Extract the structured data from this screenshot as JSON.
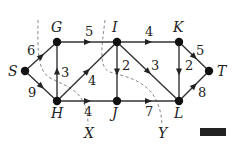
{
  "nodes": [
    {
      "id": "S",
      "label": "S",
      "x": 25,
      "y": 71,
      "lx": 8,
      "ly": 76
    },
    {
      "id": "G",
      "label": "G",
      "x": 57,
      "y": 42,
      "lx": 51,
      "ly": 32
    },
    {
      "id": "I",
      "label": "I",
      "x": 117,
      "y": 42,
      "lx": 112,
      "ly": 32
    },
    {
      "id": "K",
      "label": "K",
      "x": 179,
      "y": 42,
      "lx": 173,
      "ly": 32
    },
    {
      "id": "T",
      "label": "T",
      "x": 209,
      "y": 71,
      "lx": 217,
      "ly": 76
    },
    {
      "id": "H",
      "label": "H",
      "x": 57,
      "y": 101,
      "lx": 51,
      "ly": 118
    },
    {
      "id": "J",
      "label": "J",
      "x": 117,
      "y": 101,
      "lx": 112,
      "ly": 118
    },
    {
      "id": "L",
      "label": "L",
      "x": 179,
      "y": 101,
      "lx": 174,
      "ly": 118
    }
  ],
  "edges": [
    {
      "from": "S",
      "to": "G",
      "weight": "6",
      "wx": 27,
      "wy": 55
    },
    {
      "from": "S",
      "to": "H",
      "weight": "9",
      "wx": 28,
      "wy": 97
    },
    {
      "from": "H",
      "to": "G",
      "weight": "3",
      "wx": 61,
      "wy": 77
    },
    {
      "from": "G",
      "to": "I",
      "weight": "5",
      "wx": 85,
      "wy": 36
    },
    {
      "from": "H",
      "to": "I",
      "weight": "4",
      "wx": 88,
      "wy": 85
    },
    {
      "from": "H",
      "to": "J",
      "weight": "4",
      "wx": 84,
      "wy": 116
    },
    {
      "from": "I",
      "to": "J",
      "weight": "2",
      "wx": 122,
      "wy": 70
    },
    {
      "from": "I",
      "to": "L",
      "weight": "3",
      "wx": 151,
      "wy": 70
    },
    {
      "from": "I",
      "to": "K",
      "weight": "4",
      "wx": 145,
      "wy": 36
    },
    {
      "from": "K",
      "to": "L",
      "weight": "2",
      "wx": 185,
      "wy": 70
    },
    {
      "from": "K",
      "to": "T",
      "weight": "5",
      "wx": 196,
      "wy": 55
    },
    {
      "from": "L",
      "to": "T",
      "weight": "8",
      "wx": 198,
      "wy": 97
    },
    {
      "from": "J",
      "to": "L",
      "weight": "7",
      "wx": 145,
      "wy": 116
    }
  ],
  "cuts": [
    {
      "label": "X",
      "path": "M38,20 C38,45 36,70 50,78 C70,88 88,92 88,125",
      "lx": 84,
      "ly": 138
    },
    {
      "label": "Y",
      "path": "M105,20 C102,45 98,68 110,72 C130,78 160,82 162,125",
      "lx": 158,
      "ly": 138
    }
  ]
}
